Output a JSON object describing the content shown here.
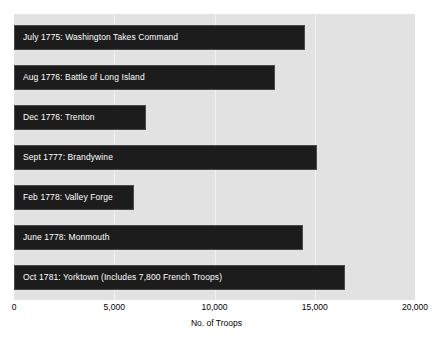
{
  "chart_data": {
    "type": "bar",
    "orientation": "horizontal",
    "title": "",
    "xlabel": "No. of  Troops",
    "ylabel": "",
    "xlim": [
      0,
      20000
    ],
    "xticks": [
      0,
      5000,
      10000,
      15000,
      20000
    ],
    "xtick_labels": [
      "0",
      "5,000",
      "10,000",
      "15,000",
      "20,000"
    ],
    "grid": true,
    "grid_axis": "x",
    "legend": false,
    "plot_background": "#e2e2e2",
    "bar_color": "#1c1c1c",
    "bar_label_color": "#ffffff",
    "categories": [
      "July 1775: Washington Takes Command",
      "Aug 1776: Battle of Long Island",
      "Dec 1776: Trenton",
      "Sept 1777: Brandywine",
      "Feb 1778: Valley Forge",
      "June 1778: Monmouth",
      "Oct 1781: Yorktown (Includes 7,800 French Troops)"
    ],
    "values": [
      14500,
      13000,
      6600,
      15100,
      6000,
      14400,
      16500
    ]
  }
}
